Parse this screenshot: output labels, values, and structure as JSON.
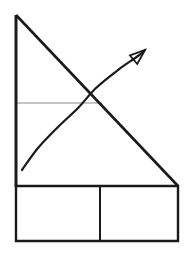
{
  "figure": {
    "background_color": "#ffffff",
    "width": 196,
    "height": 256
  },
  "style": {
    "line_color": "#1a1a1a",
    "thin_line_color": "#8c8c8c",
    "main_line_width": 2.6,
    "curve_line_width": 2.2,
    "thin_line_width": 1.0,
    "box_line_width": 2.4
  },
  "chart_data": {
    "type": "line",
    "title": "",
    "xlabel": "",
    "ylabel": "",
    "grid": false,
    "legend": "none",
    "axes": {
      "vertical_axis": {
        "name": "vertical-axis",
        "x": 16,
        "y_top": 15,
        "y_bottom": 186,
        "color": "#1a1a1a"
      },
      "horizontal_baseline": {
        "name": "rectangle-top-edge",
        "y": 186,
        "x_left": 16,
        "x_right": 178,
        "color": "#1a1a1a"
      }
    },
    "series": [
      {
        "name": "descending-line",
        "type": "line",
        "shape": "straight",
        "direction": "downward-sloping",
        "color": "#1a1a1a",
        "points": [
          [
            16,
            15
          ],
          [
            178,
            186
          ]
        ]
      },
      {
        "name": "rising-curve",
        "type": "line",
        "shape": "concave-down",
        "direction": "upward-sloping",
        "color": "#1a1a1a",
        "has_arrowhead": true,
        "arrowhead_style": "open-triangle",
        "points": [
          [
            22,
            170
          ],
          [
            38,
            148
          ],
          [
            58,
            127
          ],
          [
            78,
            108
          ],
          [
            96,
            88
          ],
          [
            118,
            70
          ],
          [
            138,
            56
          ]
        ],
        "arrow_tip": [
          145,
          50
        ]
      },
      {
        "name": "reference-level-line",
        "type": "line",
        "shape": "horizontal",
        "color": "#8c8c8c",
        "points": [
          [
            16,
            103
          ],
          [
            102,
            103
          ]
        ]
      }
    ],
    "annotations": [
      {
        "name": "intersection-point",
        "x": 96,
        "y": 88,
        "label": ""
      }
    ],
    "table_region": {
      "name": "bottom-table",
      "x_left": 16,
      "x_right": 178,
      "y_top": 186,
      "y_bottom": 241,
      "divider_x": 100,
      "columns": 2,
      "rows": 1,
      "cells": [
        {
          "name": "cell-left",
          "text": ""
        },
        {
          "name": "cell-right",
          "text": ""
        }
      ]
    }
  }
}
